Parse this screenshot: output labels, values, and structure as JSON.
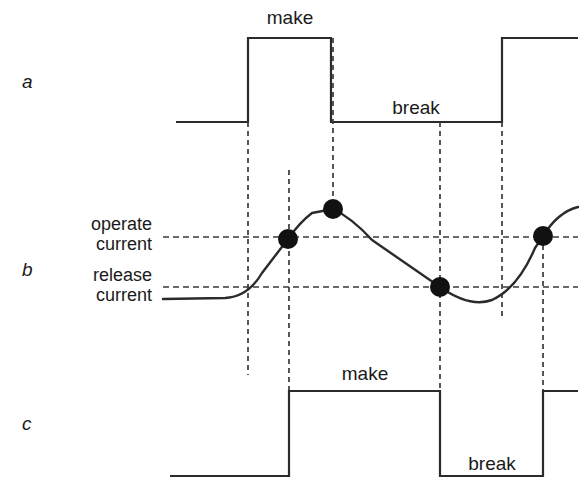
{
  "figure": {
    "width": 587,
    "height": 499,
    "background": "#ffffff",
    "line_color": "#2b2b2b",
    "dash_color": "#3a3a3a",
    "dot_color": "#111111"
  },
  "rows": {
    "a": {
      "label": "a",
      "label_x": 28,
      "label_y": 88
    },
    "b": {
      "label": "b",
      "label_x": 28,
      "label_y": 276
    },
    "c": {
      "label": "c",
      "label_y": 430,
      "label_x": 28
    }
  },
  "trace_a": {
    "name": "input-signal",
    "labels": [
      {
        "text": "make",
        "x": 290,
        "y": 24
      },
      {
        "text": "break",
        "x": 416,
        "y": 114
      }
    ],
    "path": "M 176 122 L 248 122 L 248 38 L 331 38 L 331 122 L 502 122 L 502 38 L 578 38",
    "levels": {
      "low_y": 122,
      "high_y": 38
    },
    "edges": [
      248,
      331,
      502
    ]
  },
  "trace_b": {
    "name": "coil-current",
    "thresholds": [
      {
        "id": "operate",
        "label_line1": "operate",
        "label_line2": "current",
        "y": 237
      },
      {
        "id": "release",
        "label_line1": "release",
        "label_line2": "current",
        "y": 287
      }
    ],
    "label_x": 152,
    "dash_start_x": 163,
    "dash_end_x": 578,
    "path": "M 163 299 L 225 298 Q 248 297 262 273 L 288 239 Q 300 222 312 213 L 333 209 Q 352 218 372 240 L 440 287 Q 470 308 492 300 Q 518 288 535 248 L 543 236 Q 558 212 578 207",
    "dots": [
      {
        "id": "operate-rising",
        "x": 288,
        "y": 239,
        "r": 10
      },
      {
        "id": "peak",
        "x": 333,
        "y": 209,
        "r": 10
      },
      {
        "id": "release-falling",
        "x": 440,
        "y": 287,
        "r": 10
      },
      {
        "id": "operate-rising-2",
        "x": 543,
        "y": 236,
        "r": 10
      }
    ]
  },
  "trace_c": {
    "name": "contact-output",
    "labels": [
      {
        "text": "make",
        "x": 365,
        "y": 380
      },
      {
        "text": "break",
        "x": 492,
        "y": 470
      }
    ],
    "path": "M 170 476 L 289 476 L 289 391 L 440 391 L 440 476 L 543 476 L 543 391 L 578 391",
    "levels": {
      "low_y": 476,
      "high_y": 391
    },
    "edges": [
      289,
      440,
      543
    ]
  },
  "vertical_dashed_lines": [
    {
      "id": "v-a-rise",
      "x": 248,
      "y1": 122,
      "y2": 375
    },
    {
      "id": "v-b-operate",
      "x": 289,
      "y1": 170,
      "y2": 391
    },
    {
      "id": "v-b-peak",
      "x": 333,
      "y1": 38,
      "y2": 209
    },
    {
      "id": "v-b-release",
      "x": 440,
      "y1": 287,
      "y2": 391
    },
    {
      "id": "v-a-fall",
      "x": 440,
      "y1": 122,
      "y2": 287
    },
    {
      "id": "v-a-rise-2",
      "x": 502,
      "y1": 122,
      "y2": 320
    },
    {
      "id": "v-b-operate-2",
      "x": 543,
      "y1": 236,
      "y2": 391
    }
  ]
}
